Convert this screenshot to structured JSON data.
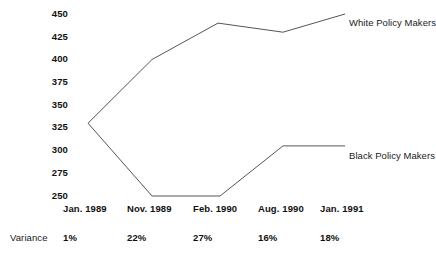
{
  "chart_data": {
    "type": "line",
    "title": "",
    "xlabel": "",
    "ylabel": "",
    "categories": [
      "Jan. 1989",
      "Nov. 1989",
      "Feb. 1990",
      "Aug. 1990",
      "Jan. 1991"
    ],
    "ylim": [
      250,
      450
    ],
    "yticks": [
      450,
      425,
      400,
      375,
      350,
      325,
      300,
      275,
      250
    ],
    "grid": false,
    "legend_position": "right-inline-end-of-line",
    "series": [
      {
        "name": "White Policy Makers",
        "values": [
          330,
          400,
          440,
          430,
          450
        ],
        "color": "#555555"
      },
      {
        "name": "Black Policy Makers",
        "values": [
          330,
          250,
          250,
          305,
          305
        ],
        "color": "#555555"
      }
    ],
    "annotations": {
      "variance_caption": "Variance",
      "variance_values": [
        "1%",
        "22%",
        "27%",
        "16%",
        "18%"
      ]
    }
  },
  "y_axis": {
    "ticks": [
      {
        "label": "450"
      },
      {
        "label": "425"
      },
      {
        "label": "400"
      },
      {
        "label": "375"
      },
      {
        "label": "350"
      },
      {
        "label": "325"
      },
      {
        "label": "300"
      },
      {
        "label": "275"
      },
      {
        "label": "250"
      }
    ]
  },
  "x_axis": {
    "ticks": [
      {
        "label": "Jan. 1989"
      },
      {
        "label": "Nov. 1989"
      },
      {
        "label": "Feb. 1990"
      },
      {
        "label": "Aug. 1990"
      },
      {
        "label": "Jan. 1991"
      }
    ]
  },
  "variance": {
    "caption": "Variance",
    "values": [
      {
        "label": "1%"
      },
      {
        "label": "22%"
      },
      {
        "label": "27%"
      },
      {
        "label": "16%"
      },
      {
        "label": "18%"
      }
    ]
  },
  "series_labels": {
    "white": "White Policy Makers",
    "black": "Black Policy Makers"
  },
  "colors": {
    "line": "#555555",
    "text": "#1a1a1a",
    "background": "#ffffff"
  }
}
